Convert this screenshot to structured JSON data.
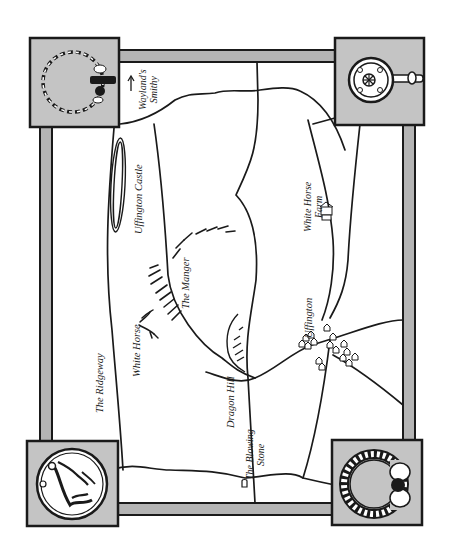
{
  "map": {
    "colors": {
      "background": "#ffffff",
      "frame_fill": "#b4b4b4",
      "box_fill": "#c4c4c4",
      "ink": "#1a1a1a"
    },
    "corner_ornaments": [
      {
        "position": "top-left",
        "icon": "torc-necklace-icon"
      },
      {
        "position": "top-right",
        "icon": "ornate-disc-pin-icon"
      },
      {
        "position": "bottom-left",
        "icon": "horse-coin-icon"
      },
      {
        "position": "bottom-right",
        "icon": "crescent-armlet-icon"
      }
    ],
    "labels": {
      "waylands_line1": "Wayland's",
      "waylands_line2": "Smithy",
      "uffington_castle": "Uffington Castle",
      "white_horse_farm_line1": "White Horse",
      "white_horse_farm_line2": "Farm",
      "the_manger": "The Manger",
      "white_horse": "White Horse",
      "the_ridgeway": "The Ridgeway",
      "dragon_hill": "Dragon Hill",
      "uffington": "Uffington",
      "blowing_stone_line1": "The Blowing",
      "blowing_stone_line2": "Stone"
    }
  }
}
